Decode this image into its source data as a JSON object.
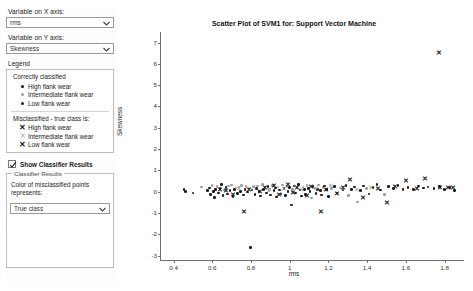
{
  "sidebar": {
    "x_axis": {
      "label": "Variable on X axis:",
      "value": "rms",
      "icon": "chevron-down-icon"
    },
    "y_axis": {
      "label": "Variable on Y axis:",
      "value": "Skewness",
      "icon": "chevron-down-icon"
    },
    "legend": {
      "title": "Legend",
      "correct_heading": "Correctly classified",
      "correct_items": [
        {
          "marker": "dot-dark",
          "label": "High flank wear"
        },
        {
          "marker": "dot-gray",
          "label": "Intermediate flank wear"
        },
        {
          "marker": "dot-dark",
          "label": "Low flank wear"
        }
      ],
      "misclassified_heading": "Misclassified - true class is:",
      "misclassified_items": [
        {
          "marker": "x-dark",
          "label": "High flank wear"
        },
        {
          "marker": "x-gray",
          "label": "Intermediate flank wear"
        },
        {
          "marker": "x-dark",
          "label": "Low flank wear"
        }
      ]
    },
    "show_classifier_results": {
      "label": "Show Classifier Results",
      "checked": true
    },
    "classifier_results": {
      "title": "Classifier Results",
      "description": "Color of misclassified points represents:",
      "value": "True class",
      "icon": "chevron-down-icon"
    }
  },
  "chart_data": {
    "type": "scatter",
    "title": "Scatter Plot of SVM1 for: Support Vector Machine",
    "xlabel": "rms",
    "ylabel": "Skewness",
    "xlim": [
      0.33,
      1.9
    ],
    "ylim": [
      -3.2,
      7.4
    ],
    "xticks": [
      0.4,
      0.6,
      0.8,
      1,
      1.2,
      1.4,
      1.6,
      1.8
    ],
    "xtick_labels": [
      "0.4",
      "0.6",
      "0.8",
      "1",
      "1.2",
      "1.4",
      "1.6",
      "1.8"
    ],
    "yticks": [
      -3,
      -2,
      -1,
      0,
      1,
      2,
      3,
      4,
      5,
      6,
      7
    ],
    "ytick_labels": [
      "-3",
      "-2",
      "-1",
      "0",
      "1",
      "2",
      "3",
      "4",
      "5",
      "6",
      "7"
    ],
    "grid": false,
    "legend_position": "sidebar",
    "colors": {
      "dark": "#1b1b1b",
      "gray": "#9d9d9d"
    },
    "series": [
      {
        "name": "Correctly classified",
        "marker": "dot",
        "points": [
          [
            0.455,
            0.1,
            "dark"
          ],
          [
            0.462,
            0.02,
            "dark"
          ],
          [
            0.5,
            -0.05,
            "dark"
          ],
          [
            0.545,
            0.22,
            "gray"
          ],
          [
            0.575,
            0.05,
            "dark"
          ],
          [
            0.585,
            0.18,
            "dark"
          ],
          [
            0.592,
            -0.12,
            "dark"
          ],
          [
            0.598,
            0.3,
            "gray"
          ],
          [
            0.605,
            0.02,
            "dark"
          ],
          [
            0.612,
            -0.28,
            "dark"
          ],
          [
            0.618,
            0.12,
            "dark"
          ],
          [
            0.625,
            0.25,
            "gray"
          ],
          [
            0.632,
            -0.05,
            "dark"
          ],
          [
            0.64,
            0.15,
            "dark"
          ],
          [
            0.648,
            0.35,
            "dark"
          ],
          [
            0.655,
            -0.18,
            "dark"
          ],
          [
            0.662,
            0.08,
            "gray"
          ],
          [
            0.67,
            0.2,
            "dark"
          ],
          [
            0.678,
            -0.1,
            "dark"
          ],
          [
            0.685,
            0.28,
            "gray"
          ],
          [
            0.692,
            0.05,
            "dark"
          ],
          [
            0.7,
            0.32,
            "gray"
          ],
          [
            0.708,
            -0.22,
            "dark"
          ],
          [
            0.715,
            0.12,
            "dark"
          ],
          [
            0.722,
            0.18,
            "gray"
          ],
          [
            0.73,
            -0.08,
            "dark"
          ],
          [
            0.738,
            0.22,
            "gray"
          ],
          [
            0.745,
            0.02,
            "dark"
          ],
          [
            0.752,
            0.3,
            "gray"
          ],
          [
            0.76,
            -0.15,
            "dark"
          ],
          [
            0.768,
            0.1,
            "dark"
          ],
          [
            0.775,
            0.25,
            "gray"
          ],
          [
            0.782,
            -0.02,
            "dark"
          ],
          [
            0.79,
            0.18,
            "gray"
          ],
          [
            0.798,
            -2.6,
            "dark"
          ],
          [
            0.805,
            0.08,
            "dark"
          ],
          [
            0.812,
            0.22,
            "gray"
          ],
          [
            0.82,
            -0.12,
            "dark"
          ],
          [
            0.828,
            0.15,
            "dark"
          ],
          [
            0.835,
            0.28,
            "gray"
          ],
          [
            0.842,
            0.02,
            "dark"
          ],
          [
            0.85,
            -0.2,
            "dark"
          ],
          [
            0.858,
            0.35,
            "gray"
          ],
          [
            0.865,
            0.1,
            "dark"
          ],
          [
            0.872,
            0.2,
            "gray"
          ],
          [
            0.88,
            -0.05,
            "dark"
          ],
          [
            0.888,
            0.25,
            "dark"
          ],
          [
            0.895,
            0.12,
            "gray"
          ],
          [
            0.902,
            -0.15,
            "dark"
          ],
          [
            0.91,
            0.3,
            "gray"
          ],
          [
            0.918,
            0.05,
            "dark"
          ],
          [
            0.925,
            0.18,
            "dark"
          ],
          [
            0.932,
            -0.25,
            "dark"
          ],
          [
            0.94,
            0.22,
            "gray"
          ],
          [
            0.948,
            0.08,
            "dark"
          ],
          [
            0.955,
            -0.1,
            "dark"
          ],
          [
            0.962,
            0.32,
            "gray"
          ],
          [
            0.97,
            0.15,
            "dark"
          ],
          [
            0.978,
            -0.18,
            "dark"
          ],
          [
            0.985,
            0.25,
            "gray"
          ],
          [
            0.992,
            0.02,
            "dark"
          ],
          [
            1.0,
            0.2,
            "dark"
          ],
          [
            1.008,
            -0.62,
            "dark"
          ],
          [
            1.015,
            0.12,
            "gray"
          ],
          [
            1.022,
            0.28,
            "dark"
          ],
          [
            1.03,
            -0.05,
            "dark"
          ],
          [
            1.038,
            0.18,
            "gray"
          ],
          [
            1.045,
            0.35,
            "dark"
          ],
          [
            1.052,
            0.08,
            "dark"
          ],
          [
            1.06,
            -0.2,
            "dark"
          ],
          [
            1.068,
            0.22,
            "gray"
          ],
          [
            1.075,
            0.1,
            "dark"
          ],
          [
            1.082,
            -0.12,
            "dark"
          ],
          [
            1.09,
            0.3,
            "gray"
          ],
          [
            1.098,
            0.15,
            "dark"
          ],
          [
            1.105,
            0.02,
            "dark"
          ],
          [
            1.112,
            -0.3,
            "gray"
          ],
          [
            1.12,
            0.25,
            "dark"
          ],
          [
            1.128,
            0.18,
            "gray"
          ],
          [
            1.135,
            -0.08,
            "dark"
          ],
          [
            1.142,
            0.12,
            "dark"
          ],
          [
            1.15,
            0.32,
            "gray"
          ],
          [
            1.158,
            0.05,
            "dark"
          ],
          [
            1.165,
            -0.15,
            "dark"
          ],
          [
            1.172,
            0.2,
            "gray"
          ],
          [
            1.18,
            0.28,
            "dark"
          ],
          [
            1.19,
            0.1,
            "dark"
          ],
          [
            1.2,
            -0.22,
            "dark"
          ],
          [
            1.215,
            0.15,
            "gray"
          ],
          [
            1.23,
            0.25,
            "dark"
          ],
          [
            1.245,
            -0.05,
            "dark"
          ],
          [
            1.26,
            0.18,
            "gray"
          ],
          [
            1.275,
            0.08,
            "dark"
          ],
          [
            1.29,
            0.3,
            "dark"
          ],
          [
            1.305,
            -0.18,
            "gray"
          ],
          [
            1.32,
            0.12,
            "dark"
          ],
          [
            1.335,
            0.22,
            "dark"
          ],
          [
            1.35,
            -0.48,
            "gray"
          ],
          [
            1.365,
            0.05,
            "dark"
          ],
          [
            1.38,
            0.28,
            "dark"
          ],
          [
            1.395,
            0.15,
            "gray"
          ],
          [
            1.41,
            -0.1,
            "dark"
          ],
          [
            1.43,
            0.2,
            "dark"
          ],
          [
            1.45,
            0.35,
            "dark"
          ],
          [
            1.47,
            0.08,
            "dark"
          ],
          [
            1.49,
            -0.12,
            "gray"
          ],
          [
            1.51,
            0.25,
            "dark"
          ],
          [
            1.535,
            0.15,
            "dark"
          ],
          [
            1.56,
            0.3,
            "dark"
          ],
          [
            1.585,
            0.1,
            "dark"
          ],
          [
            1.61,
            0.2,
            "dark"
          ],
          [
            1.64,
            0.12,
            "dark"
          ],
          [
            1.665,
            0.28,
            "dark"
          ],
          [
            1.69,
            0.18,
            "dark"
          ],
          [
            1.715,
            0.22,
            "dark"
          ],
          [
            1.745,
            0.15,
            "dark"
          ],
          [
            1.772,
            0.25,
            "dark"
          ],
          [
            1.8,
            0.12,
            "dark"
          ],
          [
            1.828,
            0.2,
            "dark"
          ],
          [
            1.852,
            0.05,
            "dark"
          ]
        ]
      },
      {
        "name": "Misclassified",
        "marker": "x",
        "points": [
          [
            0.64,
            0.05,
            "dark"
          ],
          [
            0.672,
            0.0,
            "dark"
          ],
          [
            0.705,
            -0.15,
            "dark"
          ],
          [
            0.738,
            0.12,
            "gray"
          ],
          [
            0.762,
            -0.95,
            "dark"
          ],
          [
            0.79,
            0.08,
            "dark"
          ],
          [
            0.818,
            0.2,
            "gray"
          ],
          [
            0.845,
            -0.05,
            "dark"
          ],
          [
            0.87,
            0.15,
            "dark"
          ],
          [
            0.895,
            0.02,
            "gray"
          ],
          [
            0.92,
            0.25,
            "dark"
          ],
          [
            0.945,
            -0.18,
            "dark"
          ],
          [
            0.968,
            0.1,
            "gray"
          ],
          [
            0.992,
            0.3,
            "dark"
          ],
          [
            1.015,
            -0.08,
            "dark"
          ],
          [
            1.04,
            0.18,
            "dark"
          ],
          [
            1.065,
            0.05,
            "gray"
          ],
          [
            1.088,
            -0.22,
            "dark"
          ],
          [
            1.112,
            0.22,
            "dark"
          ],
          [
            1.135,
            0.12,
            "gray"
          ],
          [
            1.16,
            -0.95,
            "dark"
          ],
          [
            1.185,
            0.08,
            "dark"
          ],
          [
            1.215,
            0.25,
            "gray"
          ],
          [
            1.245,
            -0.12,
            "dark"
          ],
          [
            1.275,
            0.15,
            "dark"
          ],
          [
            1.31,
            0.52,
            "dark"
          ],
          [
            1.345,
            0.05,
            "gray"
          ],
          [
            1.38,
            -0.3,
            "dark"
          ],
          [
            1.42,
            0.18,
            "gray"
          ],
          [
            1.455,
            0.1,
            "dark"
          ],
          [
            1.5,
            -0.55,
            "dark"
          ],
          [
            1.545,
            0.22,
            "dark"
          ],
          [
            1.6,
            0.48,
            "dark"
          ],
          [
            1.655,
            0.12,
            "dark"
          ],
          [
            1.7,
            0.6,
            "dark"
          ],
          [
            1.775,
            0.18,
            "dark"
          ],
          [
            1.815,
            0.15,
            "dark"
          ],
          [
            1.845,
            0.15,
            "dark"
          ],
          [
            1.772,
            6.5,
            "dark"
          ]
        ]
      }
    ]
  }
}
